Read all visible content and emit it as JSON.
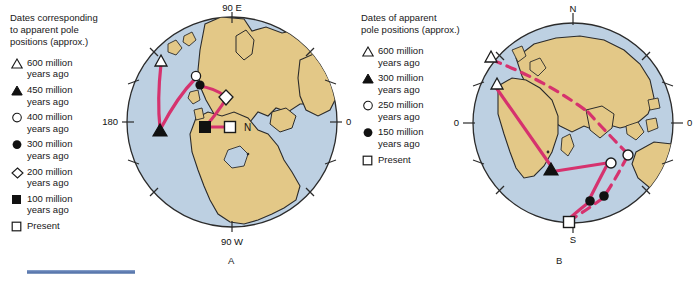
{
  "figure": {
    "panel_a_label": "A",
    "panel_b_label": "B"
  },
  "legend_a": {
    "title": "Dates corresponding\nto apparent pole\npositions (approx.)",
    "items": [
      {
        "symbol": "triangle-open",
        "label": "600 million\nyears ago"
      },
      {
        "symbol": "triangle-filled",
        "label": "450 million\nyears ago"
      },
      {
        "symbol": "circle-open",
        "label": "400 million\nyears ago"
      },
      {
        "symbol": "circle-filled",
        "label": "300 million\nyears ago"
      },
      {
        "symbol": "diamond-open",
        "label": "200 million\nyears ago"
      },
      {
        "symbol": "square-filled",
        "label": "100 million\nyears ago"
      },
      {
        "symbol": "square-open",
        "label": "Present"
      }
    ]
  },
  "legend_b": {
    "title": "Dates of apparent\npole positions (approx.)",
    "items": [
      {
        "symbol": "triangle-open",
        "label": "600 million\nyears ago"
      },
      {
        "symbol": "triangle-filled",
        "label": "300 million\nyears ago"
      },
      {
        "symbol": "circle-open",
        "label": "250 million\nyears ago"
      },
      {
        "symbol": "circle-filled",
        "label": "150 million\nyears ago"
      },
      {
        "symbol": "square-open",
        "label": "Present"
      }
    ]
  },
  "globe_a": {
    "axis_labels": {
      "top": "90 E",
      "bottom": "90 W",
      "left": "180",
      "right": "0"
    },
    "present_pole_label": "N",
    "markers": [
      {
        "symbol": "triangle-open",
        "age_ma": 600,
        "x": 161,
        "y": 61
      },
      {
        "symbol": "triangle-filled",
        "age_ma": 450,
        "x": 160,
        "y": 131
      },
      {
        "symbol": "circle-open",
        "age_ma": 400,
        "x": 196,
        "y": 76
      },
      {
        "symbol": "circle-filled",
        "age_ma": 300,
        "x": 200,
        "y": 85
      },
      {
        "symbol": "diamond-open",
        "age_ma": 200,
        "x": 226,
        "y": 97
      },
      {
        "symbol": "square-filled",
        "age_ma": 100,
        "x": 205,
        "y": 127
      },
      {
        "symbol": "square-open",
        "age_ma": 0,
        "x": 230,
        "y": 127
      }
    ]
  },
  "globe_b": {
    "axis_labels": {
      "top": "N",
      "bottom": "S",
      "left": "0",
      "right": "0"
    },
    "markers": [
      {
        "symbol": "triangle-open",
        "age_ma": 600,
        "x": 491,
        "y": 57
      },
      {
        "symbol": "triangle-open",
        "age_ma": 600,
        "x": 497,
        "y": 84
      },
      {
        "symbol": "triangle-filled",
        "age_ma": 300,
        "x": 551,
        "y": 170
      },
      {
        "symbol": "circle-open",
        "age_ma": 250,
        "x": 611,
        "y": 163
      },
      {
        "symbol": "circle-open",
        "age_ma": 250,
        "x": 628,
        "y": 155
      },
      {
        "symbol": "circle-filled",
        "age_ma": 150,
        "x": 590,
        "y": 201
      },
      {
        "symbol": "circle-filled",
        "age_ma": 150,
        "x": 604,
        "y": 196
      },
      {
        "symbol": "square-open",
        "age_ma": 0,
        "x": 569,
        "y": 222
      }
    ]
  },
  "colors": {
    "ocean": "#bdd0e2",
    "land": "#e3c887",
    "path": "#d6326e",
    "outline": "#2b2b2b",
    "rule": "#4f6ea8"
  }
}
